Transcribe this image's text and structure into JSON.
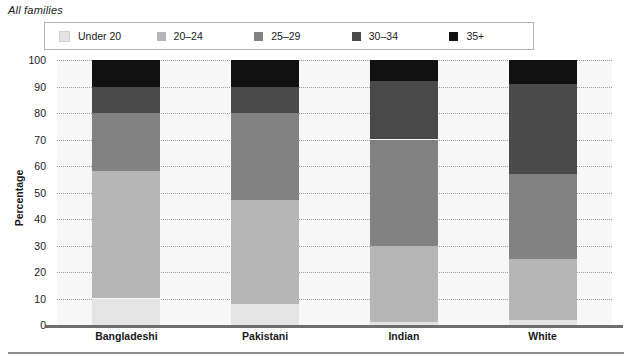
{
  "caption": "All families",
  "legend": {
    "position": "top",
    "items": [
      {
        "label": "Under 20",
        "color": "#e4e4e4"
      },
      {
        "label": "20–24",
        "color": "#b6b6b6"
      },
      {
        "label": "25–29",
        "color": "#828282"
      },
      {
        "label": "30–34",
        "color": "#4a4a4a"
      },
      {
        "label": "35+",
        "color": "#111111"
      }
    ]
  },
  "axis": {
    "ylabel": "Percentage",
    "yticks": [
      "0",
      "10",
      "20",
      "30",
      "40",
      "50",
      "60",
      "70",
      "80",
      "90",
      "100"
    ],
    "ymin": 0,
    "ymax": 100,
    "grid": true
  },
  "chart_data": {
    "type": "bar",
    "stacked": true,
    "title": "All families",
    "xlabel": "",
    "ylabel": "Percentage",
    "ylim": [
      0,
      100
    ],
    "grid": true,
    "legend_position": "top",
    "categories": [
      "Bangladeshi",
      "Pakistani",
      "Indian",
      "White"
    ],
    "series": [
      {
        "name": "Under 20",
        "color": "#e4e4e4",
        "values": [
          10,
          8,
          1,
          2
        ]
      },
      {
        "name": "20–24",
        "color": "#b6b6b6",
        "values": [
          48,
          39,
          29,
          23
        ]
      },
      {
        "name": "25–29",
        "color": "#828282",
        "values": [
          22,
          33,
          40,
          32
        ]
      },
      {
        "name": "30–34",
        "color": "#4a4a4a",
        "values": [
          10,
          10,
          22,
          34
        ]
      },
      {
        "name": "35+",
        "color": "#111111",
        "values": [
          10,
          10,
          8,
          9
        ]
      }
    ]
  }
}
